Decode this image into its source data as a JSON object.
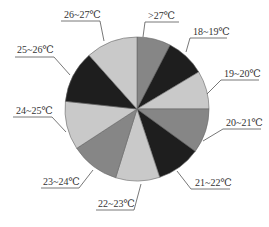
{
  "chart_data": {
    "type": "pie",
    "title": "",
    "start_angle_deg": 0,
    "direction": "clockwise",
    "categories": [
      ">27℃",
      "18~19℃",
      "19~20℃",
      "20~21℃",
      "21~22℃",
      "22~23℃",
      "23~24℃",
      "24~25℃",
      "25~26℃",
      "26~27℃"
    ],
    "values": [
      7.6,
      8.8,
      8.6,
      10.0,
      9.9,
      9.9,
      11.0,
      10.9,
      11.7,
      11.6
    ],
    "unit": "%",
    "colors": [
      "#868686",
      "#1e1e1e",
      "#c9c9c9",
      "#868686",
      "#1e1e1e",
      "#c9c9c9",
      "#868686",
      "#c9c9c9",
      "#1e1e1e",
      "#c9c9c9"
    ],
    "legend": "none (callout labels with leader lines)",
    "center": [
      137,
      109
    ],
    "radius": 72,
    "labels": [
      {
        "text": ">27℃",
        "tx": 148,
        "ty": 19,
        "ux1": 145,
        "ux2": 179,
        "uy": 22,
        "px": 143,
        "py": 37
      },
      {
        "text": "18~19℃",
        "tx": 193,
        "ty": 35,
        "ux1": 190,
        "ux2": 227,
        "uy": 38,
        "px": 186,
        "py": 52
      },
      {
        "text": "19~20℃",
        "tx": 224,
        "ty": 77,
        "ux1": 221,
        "ux2": 259,
        "uy": 80,
        "px": 207,
        "py": 94
      },
      {
        "text": "20~21℃",
        "tx": 226,
        "ty": 126,
        "ux1": 223,
        "ux2": 261,
        "uy": 129,
        "px": 203,
        "py": 141
      },
      {
        "text": "21~22℃",
        "tx": 195,
        "ty": 186,
        "ux1": 191,
        "ux2": 230,
        "uy": 189,
        "px": 177,
        "py": 171
      },
      {
        "text": "22~23℃",
        "tx": 98,
        "ty": 207,
        "ux1": 96,
        "ux2": 134,
        "uy": 210,
        "px": 141,
        "py": 184
      },
      {
        "text": "23~24℃",
        "tx": 43,
        "ty": 185,
        "ux1": 41,
        "ux2": 79,
        "uy": 188,
        "px": 93,
        "py": 170
      },
      {
        "text": "24~25℃",
        "tx": 16,
        "ty": 114,
        "ux1": 13,
        "ux2": 52,
        "uy": 117,
        "px": 66,
        "py": 132
      },
      {
        "text": "25~26℃",
        "tx": 17,
        "ty": 53,
        "ux1": 15,
        "ux2": 54,
        "uy": 57,
        "px": 70,
        "py": 75
      },
      {
        "text": "26~27℃",
        "tx": 64,
        "ty": 18,
        "ux1": 61,
        "ux2": 100,
        "uy": 21,
        "px": 104,
        "py": 41
      }
    ]
  }
}
